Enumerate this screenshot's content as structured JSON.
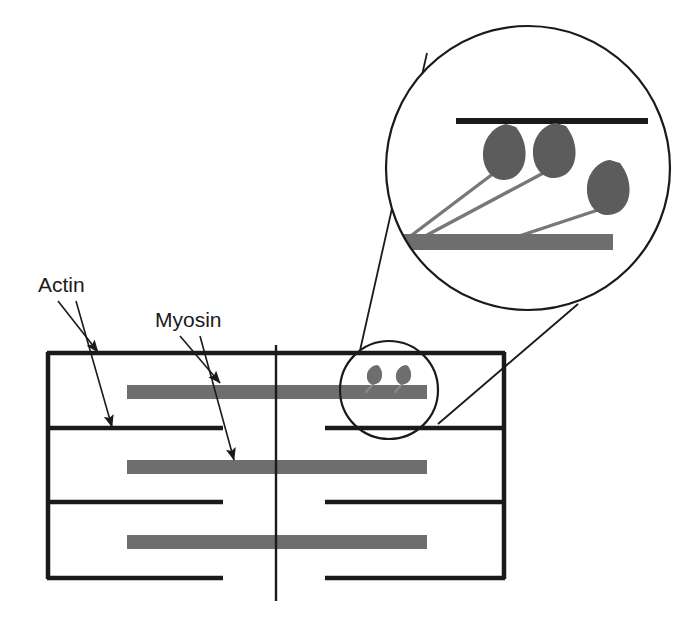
{
  "figure": {
    "background_color": "#ffffff"
  },
  "colors": {
    "line_black": "#1a1a1a",
    "filament_gray": "#6e6e6e",
    "myosin_head_gray": "#5c5c5c",
    "crossbridge_arm_gray": "#787878",
    "leader_line": "#1a1a1a"
  },
  "labels": [
    {
      "id": "actin",
      "text": "Actin",
      "x": 38,
      "y": 292,
      "pointers": 2
    },
    {
      "id": "myosin",
      "text": "Myosin",
      "x": 155,
      "y": 327,
      "pointers": 2
    }
  ],
  "leader_lines": [
    {
      "name": "actin-arrow-top",
      "x1": 58,
      "y1": 300,
      "x2": 98,
      "y2": 353
    },
    {
      "name": "actin-arrow-bottom",
      "x1": 75,
      "y1": 300,
      "x2": 110,
      "y2": 428
    },
    {
      "name": "myosin-arrow-top",
      "x1": 178,
      "y1": 335,
      "x2": 219,
      "y2": 384
    },
    {
      "name": "myosin-arrow-bottom",
      "x1": 198,
      "y1": 335,
      "x2": 232,
      "y2": 462
    }
  ],
  "sarcomere": {
    "z_line_left_x": 47,
    "z_line_right_x": 505,
    "m_line_x": 276,
    "m_line_y_top": 345,
    "m_line_y_bottom": 601,
    "top_y": 353,
    "bottom_y": 578,
    "actin_lines": [
      {
        "name": "actin-line-1",
        "y": 353,
        "x1": 47,
        "x2": 505,
        "split": false
      },
      {
        "name": "actin-line-2",
        "y": 428,
        "x1": 47,
        "x2": 505,
        "split": true,
        "gap_left": 223,
        "gap_right": 325
      },
      {
        "name": "actin-line-3",
        "y": 502,
        "x1": 47,
        "x2": 505,
        "split": true,
        "gap_left": 223,
        "gap_right": 325
      },
      {
        "name": "actin-line-4",
        "y": 578,
        "x1": 47,
        "x2": 505,
        "split": true,
        "gap_left": 223,
        "gap_right": 325
      }
    ],
    "myosin_filaments": [
      {
        "name": "myosin-filament-1",
        "x": 127,
        "y": 385,
        "width": 300,
        "height": 14
      },
      {
        "name": "myosin-filament-2",
        "x": 127,
        "y": 460,
        "width": 300,
        "height": 14
      },
      {
        "name": "myosin-filament-3",
        "x": 127,
        "y": 535,
        "width": 300,
        "height": 14
      }
    ]
  },
  "small_inset": {
    "name": "small-magnifier-circle",
    "cx": 389,
    "cy": 390,
    "r": 49,
    "heads": [
      {
        "name": "myosin-head-small-1",
        "cx": 376,
        "cy": 375,
        "rx": 6,
        "ry": 8,
        "arm_x2": 368,
        "arm_y2": 391
      },
      {
        "name": "myosin-head-small-2",
        "cx": 405,
        "cy": 375,
        "rx": 6,
        "ry": 8,
        "arm_x2": 397,
        "arm_y2": 391
      }
    ]
  },
  "large_inset": {
    "name": "large-magnifier-circle",
    "cx": 528,
    "cy": 168,
    "r": 142,
    "thick_black_line": {
      "x1": 456,
      "y1": 121,
      "x2": 648,
      "y2": 121
    },
    "thick_gray_filament": {
      "x": 404,
      "y": 234,
      "width": 209,
      "height": 16
    },
    "heads": [
      {
        "name": "myosin-head-1",
        "cx": 503,
        "cy": 150,
        "rx": 19,
        "ry": 25,
        "rot": 18,
        "arm_x2": 408,
        "arm_y2": 236
      },
      {
        "name": "myosin-head-2",
        "cx": 552,
        "cy": 148,
        "rx": 19,
        "ry": 25,
        "rot": 18,
        "arm_x2": 413,
        "arm_y2": 240
      },
      {
        "name": "myosin-head-3",
        "cx": 606,
        "cy": 185,
        "rx": 19,
        "ry": 25,
        "rot": 18,
        "arm_x2": 500,
        "arm_y2": 240
      }
    ]
  },
  "connectors": [
    {
      "name": "magnifier-connector-upper",
      "x1": 359,
      "y1": 355,
      "x2": 427,
      "y2": 53
    },
    {
      "name": "magnifier-connector-lower",
      "x1": 438,
      "y1": 424,
      "x2": 578,
      "y2": 304
    }
  ]
}
